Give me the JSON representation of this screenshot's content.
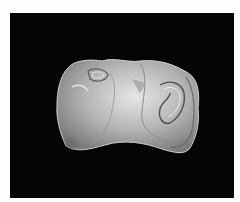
{
  "image": {
    "subject": "Polished banded agate slab on black background",
    "alt": "Banded agate slice",
    "colors": {
      "frame": "#fdfdfd",
      "background": "#050505",
      "stone_light": "#d8d8d8",
      "stone_mid": "#9a9a9a",
      "stone_dark": "#4a4a4a"
    }
  }
}
